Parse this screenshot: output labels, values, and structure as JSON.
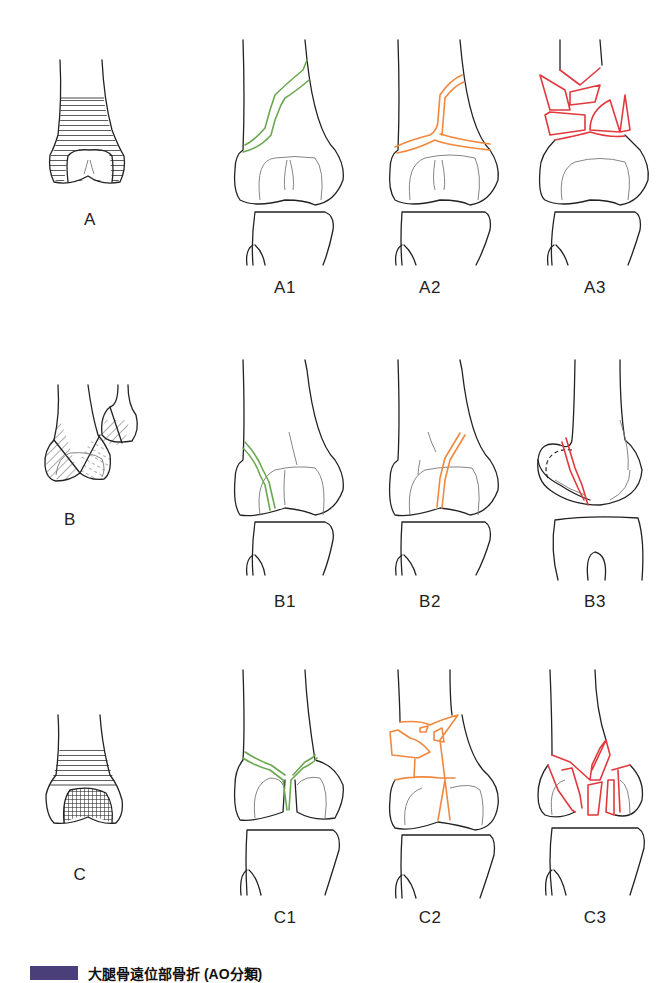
{
  "figure": {
    "colors": {
      "outline": "#222222",
      "type1_fracture": "#6aa84f",
      "type2_fracture": "#f0883e",
      "type3_fracture": "#e0393e",
      "caption_badge": "#4a3f78"
    },
    "rows": [
      {
        "group": "A",
        "overview_label": "A",
        "subtypes": [
          {
            "label": "A1",
            "color": "#6aa84f"
          },
          {
            "label": "A2",
            "color": "#f0883e"
          },
          {
            "label": "A3",
            "color": "#e0393e"
          }
        ]
      },
      {
        "group": "B",
        "overview_label": "B",
        "subtypes": [
          {
            "label": "B1",
            "color": "#6aa84f"
          },
          {
            "label": "B2",
            "color": "#f0883e"
          },
          {
            "label": "B3",
            "color": "#e0393e"
          }
        ]
      },
      {
        "group": "C",
        "overview_label": "C",
        "subtypes": [
          {
            "label": "C1",
            "color": "#6aa84f"
          },
          {
            "label": "C2",
            "color": "#f0883e"
          },
          {
            "label": "C3",
            "color": "#e0393e"
          }
        ]
      }
    ],
    "caption": {
      "badge": "",
      "text": "大腿骨遠位部骨折 (AO分類)"
    }
  }
}
